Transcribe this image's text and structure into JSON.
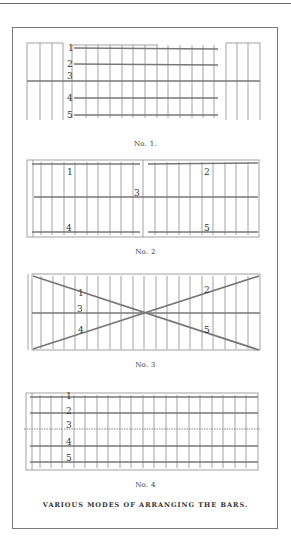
{
  "page": {
    "figures": [
      {
        "id": "no1",
        "caption": "No. 1.",
        "bar_labels": [
          "1",
          "2",
          "3",
          "4",
          "5"
        ]
      },
      {
        "id": "no2",
        "caption": "No. 2",
        "bar_labels": [
          "1",
          "2",
          "3",
          "4",
          "5"
        ]
      },
      {
        "id": "no3",
        "caption": "No. 3",
        "bar_labels": [
          "1",
          "2",
          "3",
          "4",
          "5"
        ]
      },
      {
        "id": "no4",
        "caption": "No. 4",
        "bar_labels": [
          "1",
          "2",
          "3",
          "4",
          "5"
        ]
      }
    ],
    "main_caption": "VARIOUS MODES OF ARRANGING THE BARS."
  }
}
